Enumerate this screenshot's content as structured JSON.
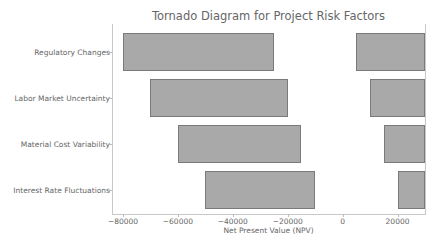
{
  "chart_data": {
    "type": "bar",
    "orientation": "horizontal",
    "subtype": "tornado",
    "title": "Tornado Diagram for Project Risk Factors",
    "xlabel": "Net Present Value (NPV)",
    "ylabel": "",
    "categories": [
      "Regulatory Changes",
      "Labor Market Uncertainty",
      "Material Cost Variability",
      "Interest Rate Fluctuations"
    ],
    "series": [
      {
        "name": "Downside",
        "ranges": [
          [
            -80000,
            -25000
          ],
          [
            -70000,
            -20000
          ],
          [
            -60000,
            -15000
          ],
          [
            -50000,
            -10000
          ]
        ]
      },
      {
        "name": "Upside",
        "ranges": [
          [
            5000,
            30000
          ],
          [
            10000,
            30000
          ],
          [
            15000,
            30000
          ],
          [
            20000,
            30000
          ]
        ]
      }
    ],
    "xticks": [
      -80000,
      -60000,
      -40000,
      -20000,
      0,
      20000
    ],
    "xtick_labels": [
      "−80000",
      "−60000",
      "−40000",
      "−20000",
      "0",
      "20000"
    ],
    "xlim": [
      -84000,
      30000
    ],
    "grid": false,
    "legend": "none",
    "bar_color": "#a9a9a9",
    "bar_edge_color": "#7a7a7a"
  }
}
